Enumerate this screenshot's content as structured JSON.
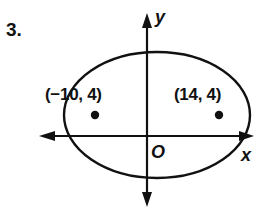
{
  "problem": {
    "number": "3."
  },
  "axes": {
    "x_label": "x",
    "y_label": "y",
    "origin_label": "O"
  },
  "ellipse": {
    "center_px": [
      157,
      115
    ],
    "rx_px": 93,
    "ry_px": 63
  },
  "points": [
    {
      "label": "(−10, 4)",
      "x": -10,
      "y": 4
    },
    {
      "label": "(14, 4)",
      "x": 14,
      "y": 4
    }
  ],
  "colors": {
    "stroke": "#111111",
    "background": "#ffffff"
  }
}
